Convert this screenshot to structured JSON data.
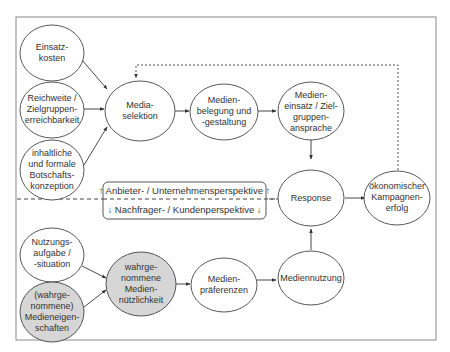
{
  "diagram": {
    "colors": {
      "stroke": "#444444",
      "frame": "#888888",
      "shaded_fill": "#d6d6d6",
      "plain_fill": "#ffffff",
      "text": "#333333"
    },
    "nodes": {
      "einsatzkosten": {
        "lines": [
          "Einsatz-",
          "kosten"
        ]
      },
      "reichweite": {
        "lines": [
          "Reichweite /",
          "Zielgruppen-",
          "erreichbarkeit"
        ]
      },
      "botschaft": {
        "lines": [
          "inhaltliche",
          "und formale",
          "Botschafts-",
          "konzeption"
        ]
      },
      "mediaselektion": {
        "lines": [
          "Media-",
          "selektion"
        ]
      },
      "medienbelegung": {
        "lines": [
          "Medien-",
          "belegung und",
          "-gestaltung"
        ]
      },
      "medieneinsatz": {
        "lines": [
          "Medien-",
          "einsatz / Ziel-",
          "gruppen-",
          "ansprache"
        ]
      },
      "response": {
        "lines": [
          "Response"
        ]
      },
      "kampagnenerfolg": {
        "lines": [
          "ökonomischer",
          "Kampagnen-",
          "erfolg"
        ]
      },
      "nutzungsaufgabe": {
        "lines": [
          "Nutzungs-",
          "aufgabe /",
          "-situation"
        ]
      },
      "medieneigenschaften": {
        "lines": [
          "(wahrge-",
          "nommene)",
          "Medieneigen-",
          "schaften"
        ]
      },
      "nuetzlichkeit": {
        "lines": [
          "wahrge-",
          "nommene",
          "Medien-",
          "nützlichkeit"
        ]
      },
      "praeferenzen": {
        "lines": [
          "Medien-",
          "präferenzen"
        ]
      },
      "mediennutzung": {
        "lines": [
          "Mediennutzung"
        ]
      }
    },
    "perspective_box": {
      "top": "↑ Anbieter- / Unternehmensperspektive ↑",
      "bottom": "↓ Nachfrager- / Kundenperspektive ↓"
    }
  }
}
